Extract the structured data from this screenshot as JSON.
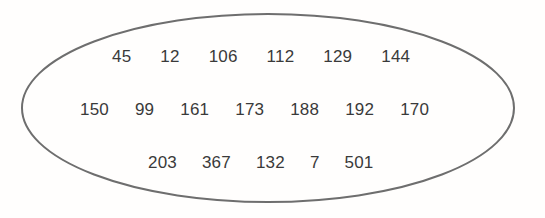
{
  "diagram": {
    "type": "set-ellipse",
    "title": "",
    "colors": {
      "background": "#fffefd",
      "ellipse_stroke": "#6e6e6e",
      "ellipse_fill": "none",
      "number_text": "#3a3a3a"
    },
    "ellipse": {
      "center_x": 268,
      "center_y": 108,
      "radius_x": 246,
      "radius_y": 94,
      "stroke_width": 2
    },
    "rows": [
      {
        "row_label": "row-1",
        "numbers": [
          "45",
          "12",
          "106",
          "112",
          "129",
          "144"
        ]
      },
      {
        "row_label": "row-2",
        "numbers": [
          "150",
          "99",
          "161",
          "173",
          "188",
          "192",
          "170"
        ]
      },
      {
        "row_label": "row-3",
        "numbers": [
          "203",
          "367",
          "132",
          "7",
          "501"
        ]
      }
    ],
    "all_numbers": [
      "45",
      "12",
      "106",
      "112",
      "129",
      "144",
      "150",
      "99",
      "161",
      "173",
      "188",
      "192",
      "170",
      "203",
      "367",
      "132",
      "7",
      "501"
    ]
  }
}
